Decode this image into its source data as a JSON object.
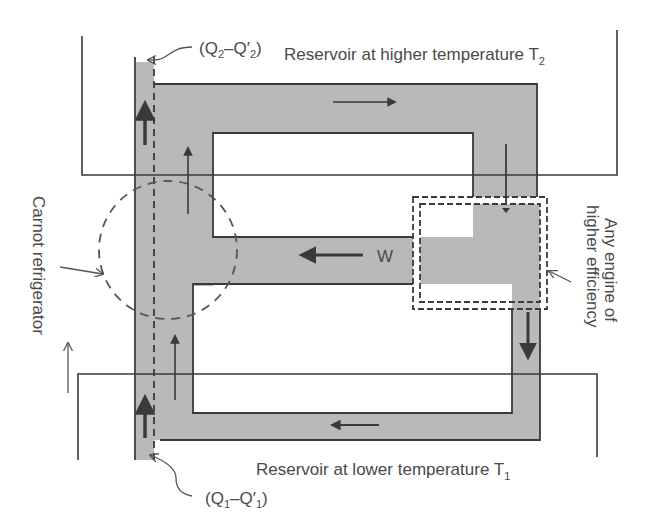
{
  "labels": {
    "q2": {
      "open": "(Q",
      "sub1": "2",
      "mid": "–Q′",
      "sub2": "2",
      "close": ")"
    },
    "hot_reservoir": {
      "text": "Reservoir at higher temperature T",
      "sub": "2"
    },
    "cold_reservoir": {
      "text": "Reservoir at lower temperature T",
      "sub": "1"
    },
    "q1": {
      "open": "(Q",
      "sub1": "1",
      "mid": "–Q′",
      "sub2": "1",
      "close": ")"
    },
    "work": "W",
    "carnot_refrigerator": "Carnot refrigerator",
    "engine_line1": "Any engine of",
    "engine_line2": "higher efficiency"
  },
  "colors": {
    "line": "#3a3a3a",
    "fill": "#b9b9b9",
    "text": "#4a4a4a",
    "background": "#ffffff"
  }
}
